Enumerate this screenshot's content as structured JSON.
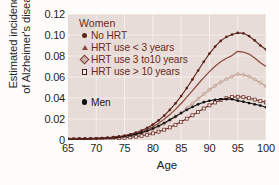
{
  "chart_data": {
    "type": "line",
    "title": "",
    "xlabel": "Age",
    "ylabel_line1": "Estimated incidence",
    "ylabel_line2": "of Alzheimer's disease",
    "xlim": [
      65,
      100
    ],
    "ylim": [
      0,
      0.12
    ],
    "xticks": [
      65,
      70,
      75,
      80,
      85,
      90,
      95,
      100
    ],
    "xticklabels": [
      "65",
      "70",
      "75",
      "80",
      "85",
      "90",
      "95",
      "100"
    ],
    "yticks": [
      0,
      0.02,
      0.04,
      0.06,
      0.08,
      0.1,
      0.12
    ],
    "yticklabels": [
      "0",
      "0.02",
      "0.04",
      "0.06",
      "0.08",
      "0.10",
      "0.12"
    ],
    "grid": true,
    "grid_color": "#f6efec",
    "plot_background": "#e8dcd8",
    "legend_position": "upper-left-inside",
    "legend_groups": [
      {
        "header": "Women",
        "entries": [
          {
            "label": "No HRT",
            "marker": "filled-circle",
            "color": "#5c241d"
          },
          {
            "label": "HRT use < 3 years",
            "marker": "filled-triangle",
            "color": "#8d493c"
          },
          {
            "label": "HRT use 3 to10 years",
            "marker": "filled-diamond",
            "color": "#c09c92"
          },
          {
            "label": "HRT use > 10 years",
            "marker": "open-square",
            "color": "#6b2a22"
          }
        ]
      },
      {
        "header": "",
        "entries": [
          {
            "label": "Men",
            "marker": "filled-circle",
            "color": "#101010"
          }
        ]
      }
    ],
    "x": [
      65,
      66,
      67,
      68,
      69,
      70,
      71,
      72,
      73,
      74,
      75,
      76,
      77,
      78,
      79,
      80,
      81,
      82,
      83,
      84,
      85,
      86,
      87,
      88,
      89,
      90,
      91,
      92,
      93,
      94,
      95,
      96,
      97,
      98,
      99,
      100
    ],
    "series": [
      {
        "name": "No HRT",
        "group": "Women",
        "color": "#5c241d",
        "marker": "filled-circle",
        "values": [
          0.0008,
          0.0009,
          0.001,
          0.0011,
          0.0013,
          0.0015,
          0.0018,
          0.0022,
          0.0027,
          0.0034,
          0.0043,
          0.0055,
          0.007,
          0.009,
          0.0115,
          0.0147,
          0.0186,
          0.0232,
          0.0286,
          0.0348,
          0.0418,
          0.0495,
          0.0577,
          0.0662,
          0.0745,
          0.0823,
          0.089,
          0.0944,
          0.0982,
          0.1004,
          0.102,
          0.1016,
          0.099,
          0.0948,
          0.09,
          0.0862
        ]
      },
      {
        "name": "HRT use < 3 years",
        "group": "Women",
        "color": "#8d493c",
        "marker": "none",
        "values": [
          0.0007,
          0.0008,
          0.0009,
          0.001,
          0.0011,
          0.0013,
          0.0016,
          0.0019,
          0.0024,
          0.003,
          0.0038,
          0.0048,
          0.0061,
          0.0078,
          0.01,
          0.0127,
          0.016,
          0.0198,
          0.0242,
          0.0292,
          0.0348,
          0.0408,
          0.047,
          0.0533,
          0.0594,
          0.0651,
          0.0702,
          0.0745,
          0.0779,
          0.0804,
          0.0845,
          0.0838,
          0.0818,
          0.078,
          0.0735,
          0.07
        ]
      },
      {
        "name": "HRT use 3 to10 years",
        "group": "Women",
        "color": "#c09c92",
        "marker": "filled-diamond",
        "values": [
          0.0006,
          0.0007,
          0.0008,
          0.0009,
          0.001,
          0.0011,
          0.0013,
          0.0016,
          0.002,
          0.0025,
          0.0031,
          0.0039,
          0.0049,
          0.0062,
          0.0079,
          0.01,
          0.0125,
          0.0153,
          0.0185,
          0.0221,
          0.0261,
          0.0304,
          0.0348,
          0.0393,
          0.0437,
          0.0479,
          0.0517,
          0.0551,
          0.058,
          0.0605,
          0.0628,
          0.0622,
          0.0605,
          0.0578,
          0.0545,
          0.0512
        ]
      },
      {
        "name": "HRT use > 10 years",
        "group": "Women",
        "color": "#6b2a22",
        "marker": "open-square",
        "values": [
          0.0005,
          0.0006,
          0.0007,
          0.0007,
          0.0008,
          0.0009,
          0.001,
          0.0012,
          0.0014,
          0.0017,
          0.0021,
          0.0026,
          0.0032,
          0.004,
          0.005,
          0.0063,
          0.0079,
          0.0098,
          0.012,
          0.0145,
          0.0173,
          0.0203,
          0.0235,
          0.0268,
          0.03,
          0.033,
          0.0357,
          0.038,
          0.0398,
          0.0409,
          0.0412,
          0.0408,
          0.0398,
          0.0385,
          0.037,
          0.0358
        ]
      },
      {
        "name": "Men",
        "group": "Men",
        "color": "#101010",
        "marker": "filled-circle",
        "values": [
          0.0008,
          0.0009,
          0.001,
          0.0011,
          0.0012,
          0.0014,
          0.0016,
          0.0019,
          0.0023,
          0.0028,
          0.0035,
          0.0044,
          0.0056,
          0.007,
          0.0088,
          0.0109,
          0.0134,
          0.0162,
          0.0192,
          0.0224,
          0.0256,
          0.0287,
          0.0315,
          0.034,
          0.036,
          0.0374,
          0.0383,
          0.0388,
          0.039,
          0.0388,
          0.0375,
          0.0365,
          0.0352,
          0.034,
          0.0328,
          0.0312
        ]
      }
    ]
  }
}
